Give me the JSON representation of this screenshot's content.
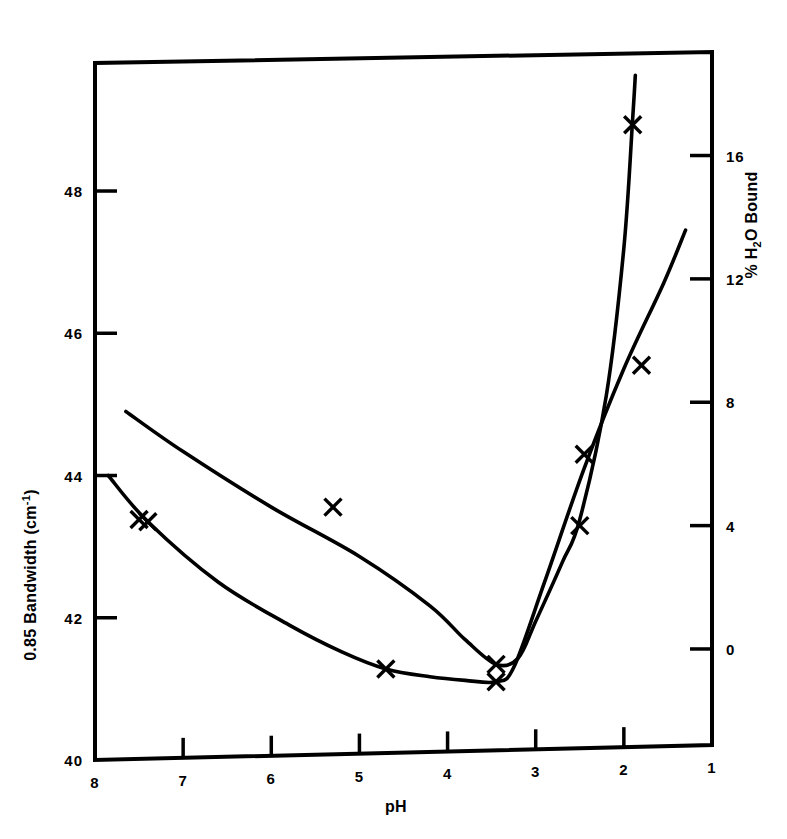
{
  "figure": {
    "background_color": "#ffffff",
    "ink_color": "#000000"
  },
  "axes": {
    "x": {
      "label": "pH",
      "ticks": [
        8,
        7,
        6,
        5,
        4,
        3,
        2,
        1
      ],
      "tick_labels": [
        "8",
        "7",
        "6",
        "5",
        "4",
        "3",
        "2",
        "1"
      ],
      "range": [
        8,
        1
      ],
      "reversed": true
    },
    "y_left": {
      "label_prefix": "0.85 Bandwidth (cm",
      "label_sup": "-1",
      "label_suffix": ")",
      "label_full": "0.85 Bandwidth (cm-1)",
      "ticks": [
        40,
        42,
        44,
        46,
        48
      ],
      "tick_labels": [
        "40",
        "42",
        "44",
        "46",
        "48"
      ],
      "range": [
        40,
        49.8
      ]
    },
    "y_right": {
      "label_prefix": "% H",
      "label_sub": "2",
      "label_suffix": "O Bound",
      "label_full": "% H2O Bound",
      "ticks": [
        0,
        4,
        8,
        12,
        16
      ],
      "tick_labels": [
        "0",
        "4",
        "8",
        "12",
        "16"
      ],
      "range": [
        -3.6,
        19.0
      ]
    }
  },
  "chart_data": {
    "type": "scatter",
    "title": "",
    "xlabel": "pH",
    "ylabel": "0.85 Bandwidth (cm-1)",
    "ylabel_right": "% H2O Bound",
    "xlim": [
      8,
      1
    ],
    "ylim": [
      40,
      49.8
    ],
    "ylim_right": [
      -3.6,
      19.0
    ],
    "grid": false,
    "legend": "none",
    "marker": "x",
    "series": [
      {
        "name": "% H2O Bound",
        "axis": "right",
        "points": [
          {
            "pH": 7.5,
            "value": 4.2,
            "on_curve": false
          },
          {
            "pH": 5.3,
            "value": 4.6,
            "on_curve": false
          },
          {
            "pH": 3.45,
            "value": -0.5,
            "on_curve": true
          },
          {
            "pH": 2.5,
            "value": 4.0,
            "on_curve": true
          },
          {
            "pH": 1.9,
            "value": 17.0,
            "on_curve": true
          }
        ],
        "curve": [
          {
            "pH": 7.65,
            "value": 7.7
          },
          {
            "pH": 7.0,
            "value": 6.4
          },
          {
            "pH": 6.0,
            "value": 4.6
          },
          {
            "pH": 5.0,
            "value": 3.0
          },
          {
            "pH": 4.2,
            "value": 1.4
          },
          {
            "pH": 3.8,
            "value": 0.3
          },
          {
            "pH": 3.45,
            "value": -0.5
          },
          {
            "pH": 3.2,
            "value": -0.3
          },
          {
            "pH": 3.0,
            "value": 0.9
          },
          {
            "pH": 2.7,
            "value": 2.8
          },
          {
            "pH": 2.5,
            "value": 4.2
          },
          {
            "pH": 2.2,
            "value": 8.2
          },
          {
            "pH": 2.0,
            "value": 13.0
          },
          {
            "pH": 1.9,
            "value": 17.2
          },
          {
            "pH": 1.87,
            "value": 18.6
          }
        ]
      },
      {
        "name": "0.85 Bandwidth (cm-1)",
        "axis": "left",
        "points": [
          {
            "pH": 7.4,
            "value": 43.35,
            "on_curve": true
          },
          {
            "pH": 4.7,
            "value": 41.28,
            "on_curve": true
          },
          {
            "pH": 3.45,
            "value": 41.1,
            "on_curve": true
          },
          {
            "pH": 2.45,
            "value": 44.3,
            "on_curve": false
          },
          {
            "pH": 1.8,
            "value": 45.55,
            "on_curve": false
          }
        ],
        "curve": [
          {
            "pH": 7.85,
            "value": 44.0
          },
          {
            "pH": 7.4,
            "value": 43.35
          },
          {
            "pH": 6.6,
            "value": 42.5
          },
          {
            "pH": 5.8,
            "value": 41.9
          },
          {
            "pH": 5.2,
            "value": 41.52
          },
          {
            "pH": 4.7,
            "value": 41.28
          },
          {
            "pH": 4.2,
            "value": 41.17
          },
          {
            "pH": 3.8,
            "value": 41.12
          },
          {
            "pH": 3.45,
            "value": 41.1
          },
          {
            "pH": 3.25,
            "value": 41.3
          },
          {
            "pH": 2.9,
            "value": 42.5
          },
          {
            "pH": 2.45,
            "value": 44.1
          },
          {
            "pH": 2.0,
            "value": 45.5
          },
          {
            "pH": 1.55,
            "value": 46.7
          },
          {
            "pH": 1.3,
            "value": 47.45
          }
        ]
      }
    ]
  }
}
